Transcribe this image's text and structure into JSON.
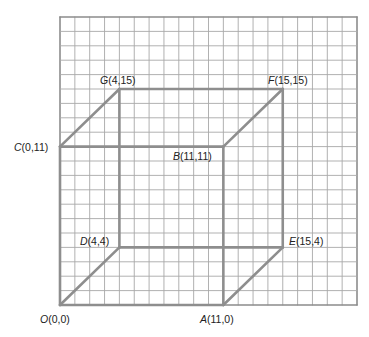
{
  "diagram": {
    "type": "coordinate-grid-cube",
    "grid": {
      "columns": 20,
      "rows": 20,
      "origin_px": [
        60,
        305
      ],
      "cell_w": 14.85,
      "cell_h": 14.4,
      "line_color": "#a8a8a8",
      "border_color": "#8c8c8c"
    },
    "cube_color": "#8e8e8e",
    "points": [
      {
        "id": "O",
        "name": "O",
        "coords": "(0,0)",
        "x": 0,
        "y": 0,
        "label_px": [
          40,
          314
        ]
      },
      {
        "id": "A",
        "name": "A",
        "coords": "(11,0)",
        "x": 11,
        "y": 0,
        "label_px": [
          200,
          314
        ]
      },
      {
        "id": "B",
        "name": "B",
        "coords": "(11,11)",
        "x": 11,
        "y": 11,
        "label_px": [
          172,
          152
        ]
      },
      {
        "id": "C",
        "name": "C",
        "coords": "(0,11)",
        "x": 0,
        "y": 11,
        "label_px": [
          14,
          142
        ]
      },
      {
        "id": "D",
        "name": "D",
        "coords": "(4,4)",
        "x": 4,
        "y": 4,
        "label_px": [
          80,
          236
        ]
      },
      {
        "id": "E",
        "name": "E",
        "coords": "(15,4)",
        "x": 15,
        "y": 4,
        "label_px": [
          289,
          236
        ]
      },
      {
        "id": "F",
        "name": "F",
        "coords": "(15,15)",
        "x": 15,
        "y": 15,
        "label_px": [
          268,
          75
        ]
      },
      {
        "id": "G",
        "name": "G",
        "coords": "(4,15)",
        "x": 4,
        "y": 15,
        "label_px": [
          100,
          75
        ]
      }
    ],
    "edges": [
      [
        "O",
        "A"
      ],
      [
        "A",
        "B"
      ],
      [
        "B",
        "C"
      ],
      [
        "C",
        "O"
      ],
      [
        "D",
        "E"
      ],
      [
        "E",
        "F"
      ],
      [
        "F",
        "G"
      ],
      [
        "G",
        "D"
      ],
      [
        "O",
        "D"
      ],
      [
        "A",
        "E"
      ],
      [
        "B",
        "F"
      ],
      [
        "C",
        "G"
      ]
    ]
  },
  "labels": {
    "O": {
      "letter": "O",
      "coords": "(0,0)"
    },
    "A": {
      "letter": "A",
      "coords": "(11,0)"
    },
    "B": {
      "letter": "B",
      "coords": "(11,11)"
    },
    "C": {
      "letter": "C",
      "coords": "(0,11)"
    },
    "D": {
      "letter": "D",
      "coords": "(4,4)"
    },
    "E": {
      "letter": "E",
      "coords": "(15,4)"
    },
    "F": {
      "letter": "F",
      "coords": "(15,15)"
    },
    "G": {
      "letter": "G",
      "coords": "(4,15)"
    }
  }
}
